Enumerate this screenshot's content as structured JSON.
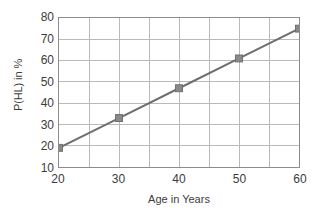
{
  "chart_data": {
    "type": "line",
    "title": "",
    "xlabel": "Age in Years",
    "ylabel": "P(HL) in %",
    "x": [
      20,
      30,
      40,
      50,
      60
    ],
    "values": [
      19,
      33,
      47,
      61,
      75
    ],
    "series": [
      {
        "name": "P(HL)",
        "x": [
          20,
          30,
          40,
          50,
          60
        ],
        "values": [
          19,
          33,
          47,
          61,
          75
        ]
      }
    ],
    "xlim": [
      20,
      60
    ],
    "ylim": [
      10,
      80
    ],
    "xticks": [
      20,
      30,
      40,
      50,
      60
    ],
    "yticks": [
      10,
      20,
      30,
      40,
      50,
      60,
      70,
      80
    ],
    "x_minor_step": 5,
    "grid": true,
    "grid_axes": "both",
    "legend": false,
    "legend_position": "none",
    "marker": "square",
    "line_color": "#6e6e6e",
    "marker_color": "#8a8a8a",
    "grid_color": "#b9b9b9",
    "frame_color": "#8c8c8c",
    "text_color": "#3c3c3c",
    "background": "#ffffff"
  },
  "axes": {
    "y_tick_labels": [
      "80",
      "70",
      "60",
      "50",
      "40",
      "30",
      "20",
      "10"
    ],
    "x_tick_labels": [
      "20",
      "30",
      "40",
      "50",
      "60"
    ],
    "y_title": "P(HL) in %",
    "x_title": "Age in Years"
  }
}
